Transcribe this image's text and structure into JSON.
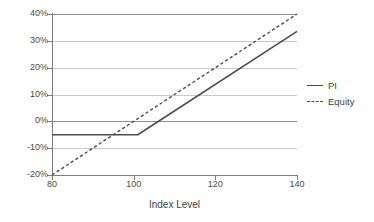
{
  "chart_data": {
    "type": "line",
    "title": "",
    "xlabel": "Index Level",
    "ylabel": "",
    "xlim": [
      80,
      140
    ],
    "ylim": [
      -20,
      40
    ],
    "grid": true,
    "legend_position": "right",
    "x_ticks": [
      "80",
      "100",
      "120",
      "140"
    ],
    "x_tick_values": [
      80,
      100,
      120,
      140
    ],
    "y_ticks": [
      "40%",
      "30%",
      "20%",
      "10%",
      "0%",
      "-10%",
      "-20%"
    ],
    "y_tick_values": [
      40,
      30,
      20,
      10,
      0,
      -10,
      -20
    ],
    "series": [
      {
        "name": "PI",
        "style": "solid",
        "color": "#4d4d4d",
        "x": [
          80,
          101,
          140
        ],
        "values": [
          -5,
          -5,
          33.5
        ]
      },
      {
        "name": "Equity",
        "style": "dashed",
        "color": "#4d4d4d",
        "x": [
          80,
          140
        ],
        "values": [
          -20,
          40
        ]
      }
    ]
  },
  "legend": {
    "entries": [
      {
        "label": "PI",
        "style": "solid"
      },
      {
        "label": "Equity",
        "style": "dashed"
      }
    ]
  },
  "axis": {
    "x_title": "Index Level"
  }
}
